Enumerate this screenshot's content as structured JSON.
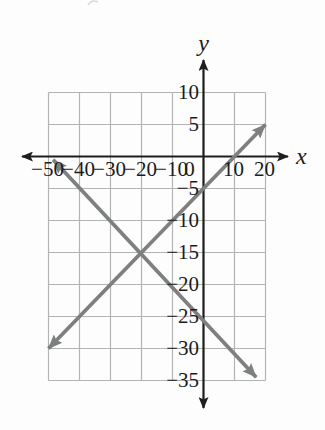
{
  "figure": {
    "background": "#fdfdfd",
    "axis_color": "#1e1e1e",
    "grid_color": "#b3b5b5",
    "line_color": "#7e8080",
    "label_color": "#1b1b1b",
    "artifact_color": "#d9d9d9"
  },
  "chart_data": {
    "type": "line",
    "title": "",
    "xlabel": "x",
    "ylabel": "y",
    "xlim": [
      -50,
      20
    ],
    "ylim": [
      -35,
      10
    ],
    "x_tick_step": 10,
    "y_tick_step": 5,
    "grid": true,
    "legend": "none",
    "x_ticks": [
      {
        "v": -50,
        "label": "−50"
      },
      {
        "v": -40,
        "label": "−40"
      },
      {
        "v": -30,
        "label": "−30"
      },
      {
        "v": -20,
        "label": "−20"
      },
      {
        "v": -10,
        "label": "−10"
      },
      {
        "v": 0,
        "label": "0"
      },
      {
        "v": 10,
        "label": "10"
      },
      {
        "v": 20,
        "label": "20"
      }
    ],
    "y_ticks": [
      {
        "v": 10,
        "label": "10"
      },
      {
        "v": 5,
        "label": "5"
      },
      {
        "v": -5,
        "label": "−5"
      },
      {
        "v": -10,
        "label": "−10"
      },
      {
        "v": -15,
        "label": "−15"
      },
      {
        "v": -20,
        "label": "−20"
      },
      {
        "v": -25,
        "label": "−25"
      },
      {
        "v": -30,
        "label": "−30"
      },
      {
        "v": -35,
        "label": "−35"
      }
    ],
    "series": [
      {
        "name": "rising-line",
        "slope": 0.5,
        "y_intercept": -5,
        "x_intercept": 10,
        "endpoints": [
          [
            -50,
            -30
          ],
          [
            20,
            5
          ]
        ],
        "arrows": "both"
      },
      {
        "name": "falling-line",
        "slope": -0.5,
        "y_intercept": -25,
        "x_intercept": -50,
        "endpoints": [
          [
            -48.5,
            -0.5
          ],
          [
            17,
            -34.5
          ]
        ],
        "arrows": "both"
      }
    ],
    "intersection": [
      -20,
      -15
    ]
  }
}
